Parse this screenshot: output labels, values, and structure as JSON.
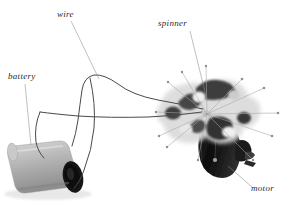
{
  "figure": {
    "kind": "labeled-photograph",
    "background_color": "#ffffff",
    "label_color": "#2b2b2b",
    "leader_color": "#8c8c8c",
    "wire_color": "#4a4a4a"
  },
  "labels": {
    "battery": "battery",
    "wire": "wire",
    "spinner": "spinner",
    "motor": "motor"
  },
  "parts": {
    "battery": {
      "name": "battery",
      "color_body": "#b9b9b9",
      "color_end": "#1e1e1e"
    },
    "wire": {
      "name": "wire",
      "color": "#4a4a4a"
    },
    "spinner": {
      "name": "spinner",
      "color_dark": "#3a3a3a",
      "color_light": "#d9d9d9",
      "blade_spot_color": "#2a2a2a"
    },
    "motor": {
      "name": "motor",
      "color": "#141414"
    }
  }
}
